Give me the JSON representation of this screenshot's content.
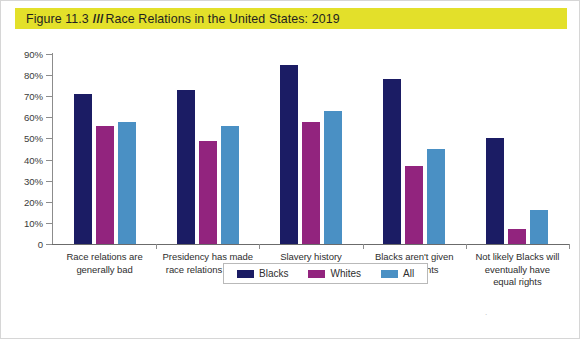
{
  "title": {
    "figure_number": "Figure 11.3",
    "separator": "///",
    "text": "Race Relations in the United States: 2019",
    "banner_color": "#e3e02a"
  },
  "chart_data": {
    "type": "bar",
    "title": "Race Relations in the United States: 2019",
    "xlabel": "",
    "ylabel": "",
    "ylim": [
      0,
      90
    ],
    "grid": false,
    "legend_position": "bottom",
    "ytick_labels": [
      "0",
      "10%",
      "20%",
      "30%",
      "40%",
      "50%",
      "60%",
      "70%",
      "80%",
      "90%"
    ],
    "ytick_values": [
      0,
      10,
      20,
      30,
      40,
      50,
      60,
      70,
      80,
      90
    ],
    "categories": [
      "Race relations are generally bad",
      "Presidency has made race relations worse",
      "Slavery history affects Blacks today",
      "Blacks aren't given equal rights",
      "Not likely Blacks will eventually have equal rights"
    ],
    "category_lines": [
      [
        "Race relations are",
        "generally bad"
      ],
      [
        "Presidency has made",
        "race relations worse"
      ],
      [
        "Slavery history",
        "affects Blacks today"
      ],
      [
        "Blacks aren't given",
        "equal rights"
      ],
      [
        "Not likely Blacks will",
        "eventually have",
        "equal rights"
      ]
    ],
    "series": [
      {
        "name": "Blacks",
        "color": "#1b1c64",
        "values": [
          71,
          73,
          85,
          78,
          50
        ]
      },
      {
        "name": "Whites",
        "color": "#92247e",
        "values": [
          56,
          49,
          58,
          37,
          7
        ]
      },
      {
        "name": "All",
        "color": "#4a90c4",
        "values": [
          58,
          56,
          63,
          45,
          16
        ]
      }
    ]
  },
  "legend": {
    "items": [
      {
        "label": "Blacks",
        "color": "#1b1c64"
      },
      {
        "label": "Whites",
        "color": "#92247e"
      },
      {
        "label": "All",
        "color": "#4a90c4"
      }
    ]
  },
  "stray_mark": "."
}
